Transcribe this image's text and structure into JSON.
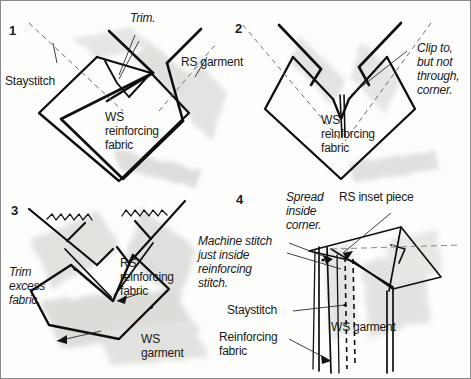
{
  "figure": {
    "type": "sewing-instruction-diagram",
    "panel_count": 4,
    "style": "hand-drawn line art with pencil shading"
  },
  "panels": [
    {
      "number": "1",
      "labels": [
        {
          "key": "staystitch",
          "text": "Staystitch"
        },
        {
          "key": "trim",
          "text": "Trim."
        },
        {
          "key": "rs_garment",
          "text": "RS garment"
        },
        {
          "key": "ws_rf_1",
          "text": "WS"
        },
        {
          "key": "ws_rf_2",
          "text": "reinforcing"
        },
        {
          "key": "ws_rf_3",
          "text": "fabric"
        }
      ]
    },
    {
      "number": "2",
      "labels": [
        {
          "key": "clip_1",
          "text": "Clip to,"
        },
        {
          "key": "clip_2",
          "text": "but not"
        },
        {
          "key": "clip_3",
          "text": "through,"
        },
        {
          "key": "clip_4",
          "text": "corner."
        },
        {
          "key": "ws_rf_1",
          "text": "WS"
        },
        {
          "key": "ws_rf_2",
          "text": "reinforcing"
        },
        {
          "key": "ws_rf_3",
          "text": "fabric"
        }
      ]
    },
    {
      "number": "3",
      "labels": [
        {
          "key": "trim_1",
          "text": "Trim"
        },
        {
          "key": "trim_2",
          "text": "excess"
        },
        {
          "key": "trim_3",
          "text": "fabric."
        },
        {
          "key": "rs_rf_1",
          "text": "RS"
        },
        {
          "key": "rs_rf_2",
          "text": "reinforcing"
        },
        {
          "key": "rs_rf_3",
          "text": "fabric"
        },
        {
          "key": "ws_g_1",
          "text": "WS"
        },
        {
          "key": "ws_g_2",
          "text": "garment"
        }
      ]
    },
    {
      "number": "4",
      "labels": [
        {
          "key": "spread_1",
          "text": "Spread"
        },
        {
          "key": "spread_2",
          "text": "inside"
        },
        {
          "key": "spread_3",
          "text": "corner."
        },
        {
          "key": "rs_inset",
          "text": "RS inset piece"
        },
        {
          "key": "machine_1",
          "text": "Machine stitch"
        },
        {
          "key": "machine_2",
          "text": "just inside"
        },
        {
          "key": "machine_3",
          "text": "reinforcing"
        },
        {
          "key": "machine_4",
          "text": "stitch."
        },
        {
          "key": "staystitch",
          "text": "Staystitch"
        },
        {
          "key": "reinf_1",
          "text": "Reinforcing"
        },
        {
          "key": "reinf_2",
          "text": "fabric"
        },
        {
          "key": "ws_garment",
          "text": "WS garment"
        }
      ]
    }
  ],
  "colors": {
    "ink": "#1a1a1a",
    "paper": "#fdfdfb",
    "shade_light": "#d9d9d6",
    "shade_mid": "#bdbdba",
    "border": "#8a8a8a"
  }
}
